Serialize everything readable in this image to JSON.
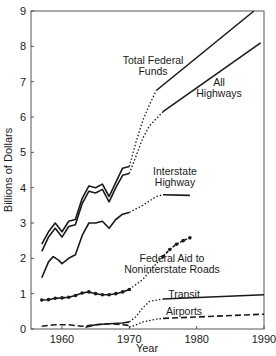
{
  "chart_data": {
    "type": "line",
    "title": "",
    "xlabel": "Year",
    "ylabel": "Billions of Dollars",
    "xlim": [
      1955.4,
      1990
    ],
    "ylim": [
      0,
      9
    ],
    "x_ticks": [
      1960,
      1970,
      1980,
      1990
    ],
    "y_ticks": [
      0,
      1,
      2,
      3,
      4,
      5,
      6,
      7,
      8,
      9
    ],
    "grid": false,
    "legend": "inline labels",
    "series": [
      {
        "name": "Total Federal Funds",
        "label_lines": [
          "Total Federal",
          "Funds"
        ],
        "style": "solid-double",
        "historical": [
          [
            1957,
            2.4
          ],
          [
            1958,
            2.75
          ],
          [
            1959,
            3.0
          ],
          [
            1960,
            2.75
          ],
          [
            1961,
            3.05
          ],
          [
            1962,
            3.1
          ],
          [
            1963,
            3.7
          ],
          [
            1964,
            4.05
          ],
          [
            1965,
            4.0
          ],
          [
            1966,
            4.1
          ],
          [
            1967,
            3.75
          ],
          [
            1968,
            4.15
          ],
          [
            1969,
            4.55
          ],
          [
            1970,
            4.6
          ]
        ],
        "transition": [
          [
            1970,
            4.6
          ],
          [
            1971,
            5.3
          ],
          [
            1972,
            5.9
          ],
          [
            1973,
            6.35
          ],
          [
            1974,
            6.75
          ]
        ],
        "projection": [
          [
            1974,
            6.75
          ],
          [
            1988.5,
            9.0
          ]
        ]
      },
      {
        "name": "All Highways",
        "label_lines": [
          "All",
          "Highways"
        ],
        "style": "solid",
        "historical": [
          [
            1957,
            2.2
          ],
          [
            1958,
            2.6
          ],
          [
            1959,
            2.85
          ],
          [
            1960,
            2.6
          ],
          [
            1961,
            2.9
          ],
          [
            1962,
            2.95
          ],
          [
            1963,
            3.55
          ],
          [
            1964,
            3.9
          ],
          [
            1965,
            3.85
          ],
          [
            1966,
            3.95
          ],
          [
            1967,
            3.6
          ],
          [
            1968,
            4.0
          ],
          [
            1969,
            4.35
          ],
          [
            1970,
            4.4
          ]
        ],
        "transition": [
          [
            1970,
            4.4
          ],
          [
            1971,
            4.9
          ],
          [
            1972,
            5.4
          ],
          [
            1973,
            5.75
          ],
          [
            1975,
            6.15
          ]
        ],
        "projection": [
          [
            1975,
            6.15
          ],
          [
            1989.5,
            8.1
          ]
        ]
      },
      {
        "name": "Interstate Highway",
        "label_lines": [
          "Interstate",
          "Highway"
        ],
        "style": "solid",
        "historical": [
          [
            1957,
            1.45
          ],
          [
            1958,
            1.9
          ],
          [
            1958.7,
            2.05
          ],
          [
            1959.5,
            1.95
          ],
          [
            1960,
            1.85
          ],
          [
            1961,
            2.0
          ],
          [
            1962,
            2.1
          ],
          [
            1963,
            2.65
          ],
          [
            1964,
            3.0
          ],
          [
            1965,
            3.0
          ],
          [
            1966,
            3.05
          ],
          [
            1967,
            2.85
          ],
          [
            1968,
            3.1
          ],
          [
            1969,
            3.25
          ],
          [
            1970,
            3.3
          ]
        ],
        "transition": [
          [
            1970,
            3.3
          ],
          [
            1972,
            3.5
          ],
          [
            1974,
            3.75
          ],
          [
            1975,
            3.8
          ]
        ],
        "projection": [
          [
            1975,
            3.8
          ],
          [
            1979,
            3.78
          ]
        ]
      },
      {
        "name": "Federal Aid to Noninterstate Roads",
        "label_lines": [
          "Federal Aid to",
          "Noninterstate Roads"
        ],
        "style": "solid-markers",
        "historical": [
          [
            1957,
            0.82
          ],
          [
            1958,
            0.83
          ],
          [
            1959,
            0.87
          ],
          [
            1960,
            0.88
          ],
          [
            1961,
            0.9
          ],
          [
            1962,
            0.95
          ],
          [
            1963,
            1.02
          ],
          [
            1964,
            1.05
          ],
          [
            1965,
            1.0
          ],
          [
            1966,
            0.97
          ],
          [
            1967,
            0.97
          ],
          [
            1968,
            1.0
          ],
          [
            1969,
            1.05
          ],
          [
            1970,
            1.12
          ]
        ],
        "transition": [
          [
            1970,
            1.12
          ],
          [
            1972,
            1.4
          ],
          [
            1974,
            1.85
          ],
          [
            1975,
            2.05
          ]
        ],
        "projection": [
          [
            1975,
            2.05
          ],
          [
            1976,
            2.25
          ],
          [
            1977,
            2.4
          ],
          [
            1978,
            2.5
          ],
          [
            1979,
            2.58
          ]
        ]
      },
      {
        "name": "Transit",
        "label_lines": [
          "Transit"
        ],
        "style": "solid",
        "historical": [
          [
            1963.5,
            0.05
          ],
          [
            1965,
            0.12
          ],
          [
            1967,
            0.15
          ],
          [
            1969,
            0.17
          ],
          [
            1970,
            0.2
          ]
        ],
        "transition": [
          [
            1970,
            0.2
          ],
          [
            1971,
            0.35
          ],
          [
            1972,
            0.6
          ],
          [
            1973,
            0.78
          ],
          [
            1975,
            0.85
          ]
        ],
        "projection": [
          [
            1975,
            0.85
          ],
          [
            1990,
            0.97
          ]
        ]
      },
      {
        "name": "Airports",
        "label_lines": [
          "Airports"
        ],
        "style": "dashed",
        "historical": [
          [
            1957,
            0.08
          ],
          [
            1959,
            0.12
          ],
          [
            1961,
            0.12
          ],
          [
            1963,
            0.08
          ],
          [
            1965,
            0.12
          ],
          [
            1967,
            0.15
          ],
          [
            1969,
            0.12
          ],
          [
            1970,
            0.1
          ]
        ],
        "transition": [
          [
            1970,
            0.05
          ],
          [
            1971,
            0.12
          ],
          [
            1972,
            0.2
          ],
          [
            1974,
            0.28
          ],
          [
            1975,
            0.3
          ]
        ],
        "projection": [
          [
            1975,
            0.3
          ],
          [
            1990,
            0.42
          ]
        ]
      }
    ],
    "annotations": [
      "Dotted segments indicate transition from actual to projected values"
    ]
  }
}
